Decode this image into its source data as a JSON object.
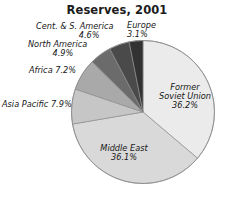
{
  "chart_data": {
    "type": "pie",
    "title": "Reserves, 2001",
    "xlabel": "",
    "ylabel": "",
    "legend_position": "none",
    "grid": false,
    "units": "percent",
    "start_angle_deg": 0,
    "direction": "clockwise",
    "categories": [
      "Former Soviet Union",
      "Middle East",
      "Asia Pacific",
      "Africa",
      "North America",
      "Cent. & S. America",
      "Europe"
    ],
    "values": [
      36.2,
      36.1,
      7.9,
      7.2,
      4.9,
      4.6,
      3.1
    ],
    "slices": [
      {
        "name": "Former Soviet Union",
        "label_line1": "Former",
        "label_line2": "Soviet Union",
        "value_label": "36.2%",
        "value": 36.2,
        "color": "#ebebeb",
        "label_placement": "inside"
      },
      {
        "name": "Middle East",
        "label_line1": "Middle East",
        "label_line2": "",
        "value_label": "36.1%",
        "value": 36.1,
        "color": "#d9d9d9",
        "label_placement": "inside"
      },
      {
        "name": "Asia Pacific",
        "label_line1": "Asia Pacific 7.9%",
        "label_line2": "",
        "value_label": "7.9%",
        "value": 7.9,
        "color": "#c6c6c6",
        "label_placement": "outside"
      },
      {
        "name": "Africa",
        "label_line1": "Africa 7.2%",
        "label_line2": "",
        "value_label": "7.2%",
        "value": 7.2,
        "color": "#a9a9a9",
        "label_placement": "outside"
      },
      {
        "name": "North America",
        "label_line1": "North America",
        "label_line2": "4.9%",
        "value_label": "4.9%",
        "value": 4.9,
        "color": "#6b6b6b",
        "label_placement": "outside"
      },
      {
        "name": "Cent. & S. America",
        "label_line1": "Cent. & S. America",
        "label_line2": "4.6%",
        "value_label": "4.6%",
        "value": 4.6,
        "color": "#4a4a4a",
        "label_placement": "outside"
      },
      {
        "name": "Europe",
        "label_line1": "Europe",
        "label_line2": "3.1%",
        "value_label": "3.1%",
        "value": 3.1,
        "color": "#323232",
        "label_placement": "outside"
      }
    ],
    "colors": {
      "background": "#ffffff",
      "outline": "#8c8c8c",
      "title_text": "#1c1c1c",
      "label_text": "#171717"
    }
  }
}
